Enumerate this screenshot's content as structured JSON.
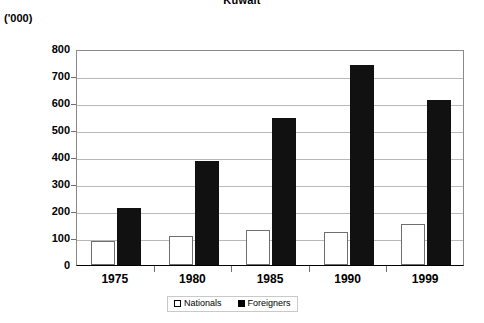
{
  "chart_data": {
    "type": "bar",
    "title": "Kuwait",
    "subtitle": "",
    "unit_label": "('000)",
    "xlabel": "",
    "ylabel": "",
    "categories": [
      "1975",
      "1980",
      "1985",
      "1990",
      "1999"
    ],
    "series": [
      {
        "name": "Nationals",
        "color": "#ffffff",
        "swatch": "open-square",
        "values": [
          90,
          110,
          132,
          123,
          152
        ]
      },
      {
        "name": "Foreigners",
        "color": "#111111",
        "swatch": "filled-square",
        "values": [
          213,
          390,
          548,
          748,
          617
        ]
      }
    ],
    "ylim": [
      0,
      800
    ],
    "ytick_step": 100,
    "ytick_labels": [
      "800",
      "700",
      "600",
      "500",
      "400",
      "300",
      "200",
      "100",
      "0"
    ],
    "grid": true,
    "legend_position": "bottom-center"
  },
  "legend": {
    "entries": [
      {
        "label": "Nationals"
      },
      {
        "label": "Foreigners"
      }
    ]
  }
}
